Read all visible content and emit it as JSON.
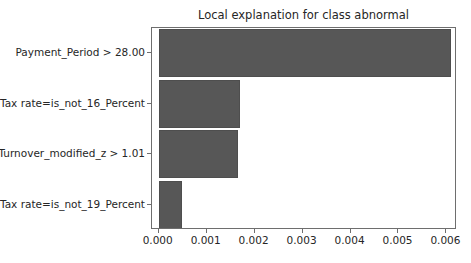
{
  "chart_data": {
    "type": "bar",
    "orientation": "horizontal",
    "title": "Local explanation for class abnormal",
    "xlabel": "",
    "ylabel": "",
    "categories": [
      "Payment_Period > 28.00",
      "Tax rate=is_not_16_Percent",
      "Turnover_modified_z > 1.01",
      "Tax rate=is_not_19_Percent"
    ],
    "values": [
      0.0061,
      0.0017,
      0.00165,
      0.00048
    ],
    "xlim": [
      -0.00014,
      0.00622
    ],
    "xticks": [
      0.0,
      0.001,
      0.002,
      0.003,
      0.004,
      0.005,
      0.006
    ],
    "xtick_labels": [
      "0.000",
      "0.001",
      "0.002",
      "0.003",
      "0.004",
      "0.005",
      "0.006"
    ],
    "grid": false,
    "legend": null,
    "bar_color": "#575757",
    "axes_color": "#6e6e6e",
    "text_color": "#262626",
    "background_color": "#ffffff"
  }
}
